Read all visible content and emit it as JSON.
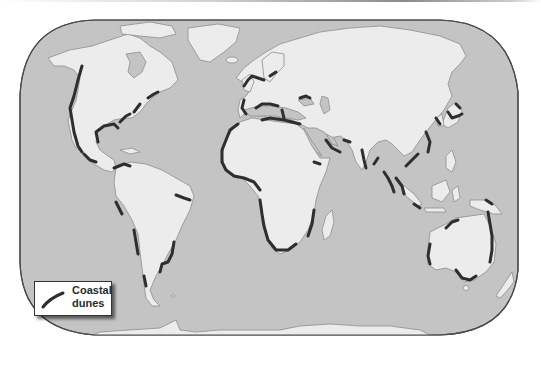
{
  "map": {
    "type": "world-map",
    "projection": "rounded-rectangle world projection",
    "colors": {
      "ocean": "#c4c4c4",
      "land": "#ececec",
      "inland_water": "#c4c4c4",
      "coastline": "#8e8e8e",
      "dune_line": "#2e2e2e",
      "frame": "#4a4a4a"
    },
    "highlighted_regions": [
      "West coast of North America",
      "East coast of North America",
      "Gulf of Mexico coast",
      "Northern South America",
      "Eastern & western South America",
      "Western Europe / North Sea",
      "Mediterranean",
      "Black Sea / Caspian",
      "West & South Africa",
      "Arabian Peninsula & South Asia",
      "East Asia / Japan",
      "Southeast Asia",
      "Australia"
    ]
  },
  "legend": {
    "line_label_1": "Coastal",
    "line_label_2": "dunes",
    "symbol": "thick-dark-line"
  }
}
